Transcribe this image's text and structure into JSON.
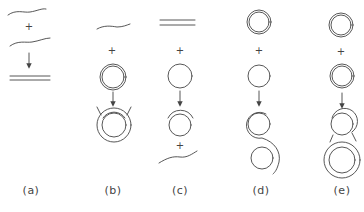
{
  "figure": {
    "panels": [
      {
        "id": "a",
        "label": "(a)",
        "description": "two single strands combine into a double-stranded helix",
        "plus_signs": [
          "+"
        ]
      },
      {
        "id": "b",
        "label": "(b)",
        "description": "single strand plus double-stranded circle yields strand invasion / triple structure",
        "plus_signs": [
          "+"
        ]
      },
      {
        "id": "c",
        "label": "(c)",
        "description": "duplex plus single circle yields circle with partial strand displacement plus released single strand",
        "plus_signs": [
          "+",
          "+"
        ]
      },
      {
        "id": "d",
        "label": "(d)",
        "description": "double circle plus single circle yields interlinked circles via strand transfer",
        "plus_signs": [
          "+"
        ]
      },
      {
        "id": "e",
        "label": "(e)",
        "description": "double circle plus double circle yields joined double circles",
        "plus_signs": [
          "+"
        ]
      }
    ]
  },
  "colors": {
    "stroke": "#444444",
    "background": "#ffffff"
  }
}
